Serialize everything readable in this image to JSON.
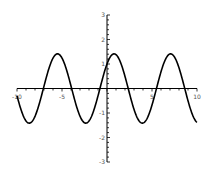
{
  "chart_data": {
    "type": "line",
    "title": "",
    "xlabel": "",
    "ylabel": "",
    "xlim": [
      -10,
      10
    ],
    "ylim": [
      -3,
      3
    ],
    "grid": false,
    "legend": "none",
    "x_ticks": [
      {
        "value": -10,
        "label": "-10"
      },
      {
        "value": -5,
        "label": "-5"
      },
      {
        "value": 5,
        "label": "5"
      },
      {
        "value": 10,
        "label": "10"
      }
    ],
    "y_ticks": [
      {
        "value": 3,
        "label": "3"
      },
      {
        "value": 2,
        "label": "2"
      },
      {
        "value": 1,
        "label": "1"
      },
      {
        "value": -1,
        "label": "-1"
      },
      {
        "value": -2,
        "label": "-2"
      },
      {
        "value": -3,
        "label": "-3"
      }
    ],
    "x_minor_step": 1,
    "y_minor_step": 0.2,
    "series": [
      {
        "name": "sin(x) + cos(x)",
        "expression": "sin(x) + cos(x)",
        "color": "#000000",
        "x": [
          -10,
          -9,
          -8,
          -7,
          -6,
          -5,
          -4,
          -3,
          -2,
          -1,
          0,
          1,
          2,
          3,
          4,
          5,
          6,
          7,
          8,
          9,
          10
        ],
        "values": [
          -0.295,
          -1.323,
          -1.135,
          0.097,
          1.24,
          1.243,
          0.103,
          -1.131,
          -1.325,
          -0.301,
          1.0,
          1.382,
          0.493,
          -0.849,
          -1.41,
          -0.675,
          0.681,
          1.411,
          0.844,
          -0.499,
          -1.383
        ]
      }
    ]
  }
}
